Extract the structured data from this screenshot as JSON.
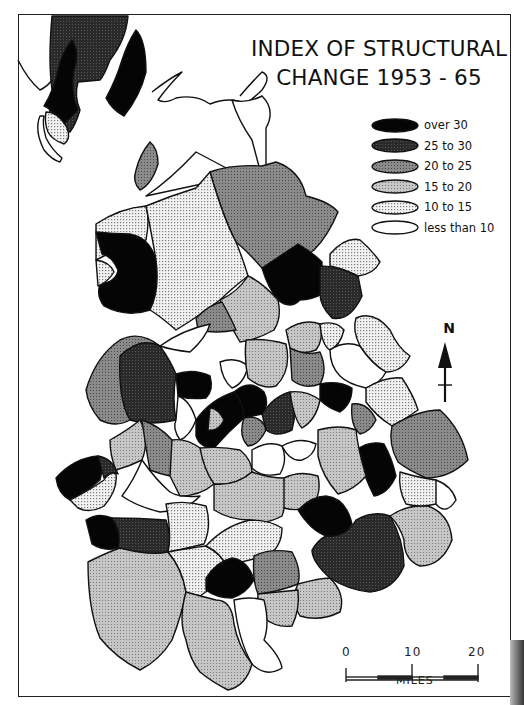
{
  "map": {
    "title_line1": "INDEX OF STRUCTURAL",
    "title_line2": "CHANGE 1953 - 65",
    "legend": [
      {
        "label": "over 30",
        "class": "c6",
        "fill": "#000000"
      },
      {
        "label": "25 to 30",
        "class": "c5",
        "fill": "#333333"
      },
      {
        "label": "20 to 25",
        "class": "c4",
        "fill": "#7a7a7a"
      },
      {
        "label": "15 to 20",
        "class": "c3",
        "fill": "#b4b4b4"
      },
      {
        "label": "10 to 15",
        "class": "c2",
        "fill": "#dcdcdc"
      },
      {
        "label": "less than 10",
        "class": "c1",
        "fill": "#ffffff"
      }
    ],
    "north_arrow": {
      "label": "N"
    },
    "scale_bar": {
      "ticks": [
        "0",
        "10",
        "20"
      ],
      "unit": "MILES"
    }
  }
}
